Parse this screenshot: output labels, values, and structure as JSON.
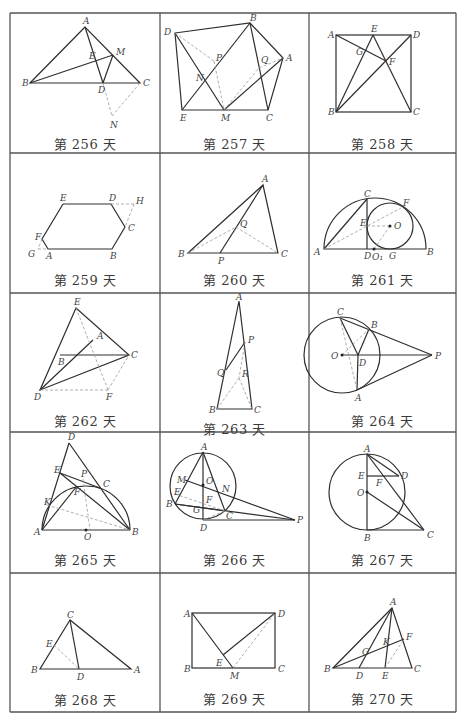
{
  "grid": {
    "columns": 3,
    "rows": 5,
    "col_x": [
      10,
      160,
      309,
      456
    ],
    "row_y": [
      13,
      153,
      293,
      432,
      573,
      712
    ],
    "line_color": "#555555"
  },
  "cells": [
    {
      "caption": "第 256 天",
      "labels": [
        "A",
        "B",
        "C",
        "D",
        "E",
        "M",
        "N"
      ]
    },
    {
      "caption": "第 257 天",
      "labels": [
        "A",
        "B",
        "C",
        "D",
        "E",
        "M",
        "N",
        "P",
        "Q"
      ]
    },
    {
      "caption": "第 258 天",
      "labels": [
        "A",
        "B",
        "C",
        "D",
        "E",
        "F",
        "G"
      ]
    },
    {
      "caption": "第 259 天",
      "labels": [
        "A",
        "B",
        "C",
        "D",
        "E",
        "F",
        "G",
        "H"
      ]
    },
    {
      "caption": "第 260 天",
      "labels": [
        "A",
        "B",
        "C",
        "P",
        "Q"
      ]
    },
    {
      "caption": "第 261 天",
      "labels": [
        "A",
        "B",
        "C",
        "D",
        "E",
        "F",
        "G",
        "O",
        "O₁"
      ]
    },
    {
      "caption": "第 262 天",
      "labels": [
        "A",
        "B",
        "C",
        "D",
        "E",
        "F"
      ]
    },
    {
      "caption": "第 263 天",
      "labels": [
        "A",
        "B",
        "C",
        "P",
        "Q",
        "R"
      ]
    },
    {
      "caption": "第 264 天",
      "labels": [
        "A",
        "B",
        "C",
        "D",
        "O",
        "P"
      ]
    },
    {
      "caption": "第 265 天",
      "labels": [
        "A",
        "B",
        "C",
        "D",
        "E",
        "F",
        "K",
        "O",
        "P"
      ]
    },
    {
      "caption": "第 266 天",
      "labels": [
        "A",
        "B",
        "C",
        "D",
        "E",
        "F",
        "G",
        "M",
        "N",
        "O",
        "P"
      ]
    },
    {
      "caption": "第 267 天",
      "labels": [
        "A",
        "B",
        "C",
        "D",
        "E",
        "F",
        "O"
      ]
    },
    {
      "caption": "第 268 天",
      "labels": [
        "A",
        "B",
        "C",
        "D",
        "E"
      ]
    },
    {
      "caption": "第 269 天",
      "labels": [
        "A",
        "B",
        "C",
        "D",
        "E",
        "M"
      ]
    },
    {
      "caption": "第 270 天",
      "labels": [
        "A",
        "B",
        "C",
        "D",
        "E",
        "F",
        "G",
        "K"
      ]
    }
  ]
}
